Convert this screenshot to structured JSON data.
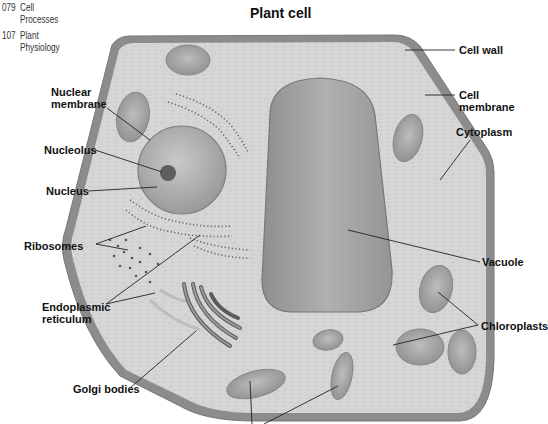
{
  "cross_references": [
    {
      "number": "079",
      "line1": "Cell",
      "line2": "Processes"
    },
    {
      "number": "107",
      "line1": "Plant",
      "line2": "Physiology"
    }
  ],
  "title": "Plant cell",
  "labels": {
    "cell_wall": "Cell wall",
    "cell_membrane_1": "Cell",
    "cell_membrane_2": "membrane",
    "cytoplasm": "Cytoplasm",
    "nuclear_membrane_1": "Nuclear",
    "nuclear_membrane_2": "membrane",
    "nucleolus": "Nucleolus",
    "nucleus": "Nucleus",
    "ribosomes": "Ribosomes",
    "er_1": "Endoplasmic",
    "er_2": "reticulum",
    "golgi": "Golgi bodies",
    "vacuole": "Vacuole",
    "chloroplasts": "Chloroplasts"
  },
  "colors": {
    "cell_wall": "#8c8c8c",
    "cytoplasm": "#d9d9d9",
    "organelle": "#a8a8a8",
    "vacuole": "#9e9e9e",
    "leader_line": "#222222"
  }
}
